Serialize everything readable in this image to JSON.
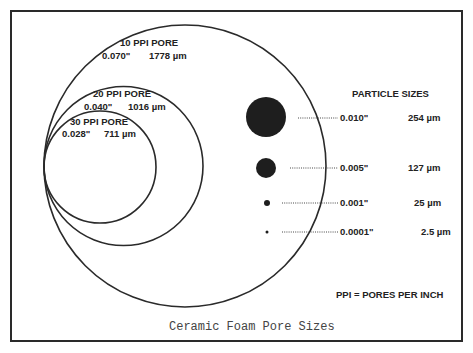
{
  "figure": {
    "caption": "Ceramic Foam Pore Sizes",
    "legend_note": "PPI = PORES PER INCH"
  },
  "pores": [
    {
      "label": "10 PPI PORE",
      "inches": "0.070\"",
      "microns": "1778 µm"
    },
    {
      "label": "20 PPI PORE",
      "inches": "0.040\"",
      "microns": "1016 µm"
    },
    {
      "label": "30 PPI PORE",
      "inches": "0.028\"",
      "microns": "711 µm"
    }
  ],
  "particles": {
    "title": "PARTICLE SIZES",
    "items": [
      {
        "inches": "0.010\"",
        "microns": "254 µm"
      },
      {
        "inches": "0.005\"",
        "microns": "127 µm"
      },
      {
        "inches": "0.001\"",
        "microns": "25 µm"
      },
      {
        "inches": "0.0001\"",
        "microns": "2.5 µm"
      }
    ]
  },
  "colors": {
    "ink": "#222222",
    "background": "#ffffff",
    "caption": "#444444"
  }
}
